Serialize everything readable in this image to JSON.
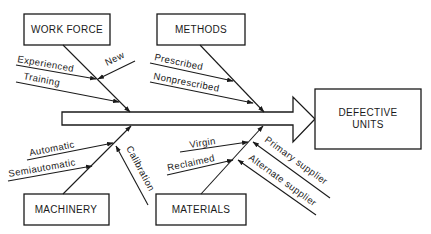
{
  "diagram": {
    "type": "fishbone",
    "effect": {
      "line1": "DEFECTIVE",
      "line2": "UNITS"
    },
    "categories": {
      "work_force": {
        "label": "WORK FORCE",
        "causes": [
          "Experienced",
          "New",
          "Training"
        ]
      },
      "methods": {
        "label": "METHODS",
        "causes": [
          "Prescribed",
          "Nonprescribed"
        ]
      },
      "machinery": {
        "label": "MACHINERY",
        "causes": [
          "Automatic",
          "Semiautomatic",
          "Calibration"
        ]
      },
      "materials": {
        "label": "MATERIALS",
        "causes": [
          "Virgin",
          "Reclaimed",
          "Primary supplier",
          "Alternate supplier"
        ]
      }
    },
    "colors": {
      "stroke": "#1a1a1a",
      "background": "#ffffff"
    }
  }
}
